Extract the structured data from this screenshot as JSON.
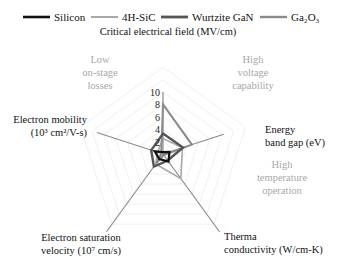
{
  "chart_data": {
    "type": "radar",
    "title": "",
    "axes": [
      {
        "name": "Critical electrical field (MV/cm)",
        "lines": [
          "Critical electrical field (MV/cm)"
        ]
      },
      {
        "name": "Energy band gap (eV)",
        "lines": [
          "Energy",
          "band gap (eV)"
        ]
      },
      {
        "name": "Therma conductivity (W/cm-K)",
        "lines": [
          "Therma",
          "conductivity (W/cm-K)"
        ]
      },
      {
        "name": "Electron saturation velocity (10^7 cm/s)",
        "lines": [
          "Electron saturation",
          "velocity (10⁷ cm/s)"
        ]
      },
      {
        "name": "Electron mobility (10^3 cm^2/V-s)",
        "lines": [
          "Electron mobility",
          "(10³ cm²/V-s)"
        ]
      }
    ],
    "range": [
      0,
      10
    ],
    "ticks": [
      "2",
      "4",
      "6",
      "8",
      "10"
    ],
    "tick_values": [
      2,
      4,
      6,
      8,
      10
    ],
    "grid": true,
    "legend_position": "top",
    "series": [
      {
        "name": "Silicon",
        "color": "#111111",
        "width": 2.2,
        "values": [
          0.3,
          1.1,
          1.5,
          1.0,
          1.4
        ]
      },
      {
        "name": "4H-SiC",
        "color": "#a9a9a9",
        "width": 1.6,
        "values": [
          2.5,
          3.3,
          4.9,
          2.0,
          0.9
        ]
      },
      {
        "name": "Wurtzite GaN",
        "color": "#555555",
        "width": 2.4,
        "values": [
          3.3,
          3.4,
          1.3,
          2.5,
          2.0
        ]
      },
      {
        "name": "Ga₂O₃",
        "color": "#8a8a8a",
        "width": 2.0,
        "values": [
          8.0,
          4.9,
          0.2,
          1.8,
          0.3
        ]
      }
    ],
    "annotations": [
      {
        "text_lines": [
          "Low",
          "on-stage",
          "losses"
        ]
      },
      {
        "text_lines": [
          "High",
          "voltage",
          "capability"
        ]
      },
      {
        "text_lines": [
          "High",
          "temperature",
          "operation"
        ]
      }
    ]
  }
}
